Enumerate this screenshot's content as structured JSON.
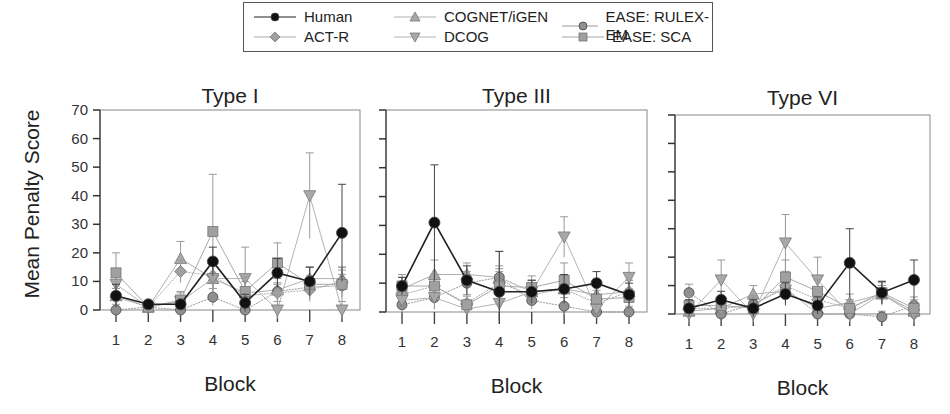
{
  "legend": [
    {
      "name": "Human",
      "marker": "circle",
      "fill": "#111111",
      "line": "#222222"
    },
    {
      "name": "COGNET/iGEN",
      "marker": "triangle-up",
      "fill": "#a8a8a8",
      "line": "#b0b0b0"
    },
    {
      "name": "EASE: RULEX-EM",
      "marker": "circle",
      "fill": "#8f8f8f",
      "line": "#999999"
    },
    {
      "name": "ACT-R",
      "marker": "diamond",
      "fill": "#a0a0a0",
      "line": "#aaaaaa"
    },
    {
      "name": "DCOG",
      "marker": "triangle-down",
      "fill": "#a8a8a8",
      "line": "#b4b4b4"
    },
    {
      "name": "EASE: SCA",
      "marker": "square",
      "fill": "#a0a0a0",
      "line": "#a8a8a8"
    }
  ],
  "ylabel": "Mean Penalty Score",
  "xlabel": "Block",
  "chart_data": [
    {
      "type": "line",
      "title": "Type I",
      "xlabel": "Block",
      "ylabel": "Mean Penalty Score",
      "x": [
        1,
        2,
        3,
        4,
        5,
        6,
        7,
        8
      ],
      "ylim": [
        0,
        70
      ],
      "yticks": [
        0,
        10,
        20,
        30,
        40,
        50,
        60,
        70
      ],
      "grid": false,
      "series": [
        {
          "name": "Human",
          "values": [
            5,
            2,
            2,
            17,
            2.5,
            13,
            10,
            27
          ],
          "err": [
            4,
            1,
            1,
            5,
            3,
            5,
            5,
            17
          ]
        },
        {
          "name": "COGNET/iGEN",
          "values": [
            5,
            1,
            18,
            11,
            6,
            7,
            11,
            11
          ],
          "err": [
            4,
            1,
            6,
            5,
            4,
            4,
            4,
            4
          ]
        },
        {
          "name": "EASE: RULEX-EM",
          "values": [
            0,
            1,
            0,
            4.5,
            0,
            6.5,
            8,
            8.5
          ],
          "err": [
            2,
            2,
            2,
            3,
            2,
            3,
            4,
            4
          ]
        },
        {
          "name": "ACT-R",
          "values": [
            4.5,
            1,
            13.5,
            12,
            5,
            6,
            7,
            10
          ],
          "err": [
            3,
            1,
            4,
            5,
            3,
            3,
            3,
            4
          ]
        },
        {
          "name": "DCOG",
          "values": [
            9,
            1,
            3,
            11,
            11,
            0,
            40,
            0
          ],
          "err": [
            5,
            1,
            3,
            5,
            11,
            3,
            15,
            3
          ]
        },
        {
          "name": "EASE: SCA",
          "values": [
            13,
            1,
            3.5,
            27.5,
            6.5,
            16.5,
            9,
            9
          ],
          "err": [
            7,
            1,
            3,
            20,
            5,
            7,
            6,
            6
          ]
        }
      ]
    },
    {
      "type": "line",
      "title": "Type III",
      "xlabel": "Block",
      "ylabel": "",
      "x": [
        1,
        2,
        3,
        4,
        5,
        6,
        7,
        8
      ],
      "ylim": [
        0,
        70
      ],
      "yticks": [
        0,
        10,
        20,
        30,
        40,
        50,
        60,
        70
      ],
      "grid": false,
      "series": [
        {
          "name": "Human",
          "values": [
            9,
            31,
            11,
            7,
            7,
            8,
            10,
            6
          ],
          "err": [
            3,
            20,
            5,
            14,
            4,
            5,
            4,
            4
          ]
        },
        {
          "name": "COGNET/iGEN",
          "values": [
            8,
            13,
            13,
            12,
            7,
            8,
            6,
            7
          ],
          "err": [
            4,
            5,
            4,
            9,
            4,
            4,
            4,
            4
          ]
        },
        {
          "name": "EASE: RULEX-EM",
          "values": [
            2.5,
            5,
            10,
            12,
            4,
            2,
            0,
            0
          ],
          "err": [
            3,
            4,
            4,
            4,
            3,
            3,
            2,
            2
          ]
        },
        {
          "name": "ACT-R",
          "values": [
            6,
            9,
            3,
            10,
            6,
            8,
            3,
            7
          ],
          "err": [
            3,
            4,
            3,
            5,
            3,
            4,
            3,
            4
          ]
        },
        {
          "name": "DCOG",
          "values": [
            4,
            5,
            1,
            3,
            7,
            26,
            1,
            12
          ],
          "err": [
            3,
            4,
            2,
            3,
            4,
            7,
            3,
            5
          ]
        },
        {
          "name": "EASE: SCA",
          "values": [
            9,
            9,
            2.5,
            9,
            8.5,
            11,
            4.5,
            5
          ],
          "err": [
            4,
            4,
            3,
            5,
            4,
            6,
            3,
            3
          ]
        }
      ]
    },
    {
      "type": "line",
      "title": "Type VI",
      "xlabel": "Block",
      "ylabel": "",
      "x": [
        1,
        2,
        3,
        4,
        5,
        6,
        7,
        8
      ],
      "ylim": [
        0,
        70
      ],
      "yticks": [
        0,
        10,
        20,
        30,
        40,
        50,
        60,
        70
      ],
      "grid": false,
      "series": [
        {
          "name": "Human",
          "values": [
            2,
            5,
            2,
            7,
            3,
            18,
            7.5,
            12
          ],
          "err": [
            3,
            3,
            3,
            4,
            3,
            12,
            4,
            7
          ]
        },
        {
          "name": "COGNET/iGEN",
          "values": [
            1,
            2,
            7,
            8,
            2,
            4,
            7,
            1
          ],
          "err": [
            3,
            3,
            3,
            4,
            3,
            3,
            3,
            3
          ]
        },
        {
          "name": "EASE: RULEX-EM",
          "values": [
            7.5,
            0,
            3.5,
            9,
            0,
            0,
            -1,
            3
          ],
          "err": [
            3,
            2,
            3,
            5,
            2,
            2,
            2,
            3
          ]
        },
        {
          "name": "ACT-R",
          "values": [
            2,
            2,
            3,
            10,
            5,
            2,
            7,
            0
          ],
          "err": [
            3,
            3,
            3,
            5,
            3,
            3,
            3,
            3
          ]
        },
        {
          "name": "DCOG",
          "values": [
            0,
            12,
            0,
            25,
            12,
            0,
            7,
            0
          ],
          "err": [
            3,
            7,
            3,
            10,
            8,
            3,
            4,
            3
          ]
        },
        {
          "name": "EASE: SCA",
          "values": [
            3,
            3,
            2,
            13,
            8,
            2,
            7.5,
            2
          ],
          "err": [
            3,
            3,
            3,
            6,
            4,
            3,
            4,
            3
          ]
        }
      ]
    }
  ]
}
